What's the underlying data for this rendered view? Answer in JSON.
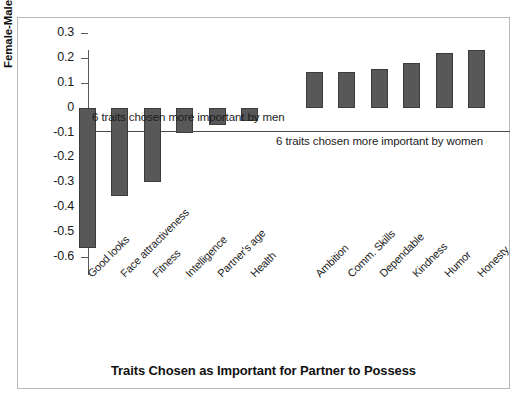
{
  "chart_data": {
    "type": "bar",
    "title": "",
    "xlabel": "Traits Chosen as Important for Partner to Possess",
    "ylabel": "Female-Male Difference in Ranks",
    "ylim": [
      -0.6,
      0.3
    ],
    "ytick_labels": [
      "0.3",
      "0.2",
      "0.1",
      "0",
      "-0.1",
      "-0.2",
      "-0.3",
      "-0.4",
      "-0.5",
      "-0.6"
    ],
    "ytick_values": [
      0.3,
      0.2,
      0.1,
      0,
      -0.1,
      -0.2,
      -0.3,
      -0.4,
      -0.5,
      -0.6
    ],
    "grid": false,
    "legend": "none",
    "bar_color": "#585858",
    "categories": [
      "Good looks",
      "Face attractiveness",
      "Fitness",
      "Intelligence",
      "Partner's age",
      "Health",
      "",
      "Ambition",
      "Comm. Skills",
      "Dependable",
      "Kindness",
      "Humor",
      "Honesty"
    ],
    "values": [
      -0.565,
      -0.355,
      -0.3,
      -0.1,
      -0.07,
      -0.055,
      null,
      0.145,
      0.145,
      0.155,
      0.18,
      0.22,
      0.23
    ],
    "annotations": [
      {
        "text": "6 traits chosen more important by men",
        "x_category": "Good looks",
        "y": 0.055
      },
      {
        "text": "6 traits chosen more important by women",
        "x_category": "Ambition",
        "y": -0.015
      }
    ]
  },
  "axis": {
    "y_title": "Female-Male Difference in Ranks",
    "x_title": "Traits Chosen as Important for Partner to Possess"
  }
}
